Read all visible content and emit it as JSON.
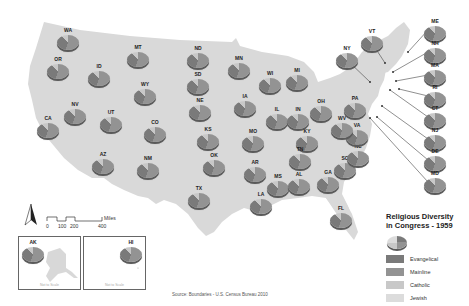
{
  "title": "Religious Diversity in Congress - 1959",
  "legend": {
    "title_line1": "Religious Diversity",
    "title_line2": "in Congress - 1959",
    "items": [
      {
        "label": "Evangelical",
        "color": "#7a7a7a"
      },
      {
        "label": "Mainline",
        "color": "#939393"
      },
      {
        "label": "Catholic",
        "color": "#c8c8c8"
      },
      {
        "label": "Jewish",
        "color": "#dcdcdc"
      }
    ]
  },
  "scale_bar": {
    "ticks": [
      "0",
      "100",
      "200",
      "400"
    ],
    "unit": "Miles"
  },
  "north_arrow": "N",
  "insets": [
    {
      "state": "AK",
      "note": "Not to Scale"
    },
    {
      "state": "HI",
      "note": "Not to Scale"
    }
  ],
  "source": "Source: Boundaries - U.S. Census Bureau 2010",
  "colors": {
    "land": "#d9d9d9",
    "evangelical": "#7a7a7a",
    "mainline": "#939393",
    "catholic": "#c8c8c8",
    "jewish": "#dcdcdc"
  },
  "states": [
    {
      "code": "WA",
      "x": 68,
      "y": 36
    },
    {
      "code": "OR",
      "x": 58,
      "y": 65
    },
    {
      "code": "ID",
      "x": 99,
      "y": 72
    },
    {
      "code": "MT",
      "x": 138,
      "y": 53
    },
    {
      "code": "WY",
      "x": 145,
      "y": 90
    },
    {
      "code": "NV",
      "x": 75,
      "y": 110
    },
    {
      "code": "UT",
      "x": 111,
      "y": 118
    },
    {
      "code": "CA",
      "x": 48,
      "y": 124
    },
    {
      "code": "CO",
      "x": 155,
      "y": 128
    },
    {
      "code": "AZ",
      "x": 103,
      "y": 160
    },
    {
      "code": "NM",
      "x": 148,
      "y": 164
    },
    {
      "code": "ND",
      "x": 198,
      "y": 54
    },
    {
      "code": "SD",
      "x": 198,
      "y": 80
    },
    {
      "code": "NE",
      "x": 200,
      "y": 106
    },
    {
      "code": "KS",
      "x": 208,
      "y": 135
    },
    {
      "code": "OK",
      "x": 214,
      "y": 161
    },
    {
      "code": "TX",
      "x": 199,
      "y": 194
    },
    {
      "code": "MN",
      "x": 239,
      "y": 64
    },
    {
      "code": "IA",
      "x": 245,
      "y": 102
    },
    {
      "code": "MO",
      "x": 253,
      "y": 137
    },
    {
      "code": "AR",
      "x": 255,
      "y": 168
    },
    {
      "code": "LA",
      "x": 261,
      "y": 200
    },
    {
      "code": "WI",
      "x": 270,
      "y": 79
    },
    {
      "code": "IL",
      "x": 277,
      "y": 115
    },
    {
      "code": "MI",
      "x": 297,
      "y": 76
    },
    {
      "code": "IN",
      "x": 298,
      "y": 115
    },
    {
      "code": "OH",
      "x": 321,
      "y": 107
    },
    {
      "code": "KY",
      "x": 307,
      "y": 137
    },
    {
      "code": "TN",
      "x": 300,
      "y": 155
    },
    {
      "code": "MS",
      "x": 278,
      "y": 182
    },
    {
      "code": "AL",
      "x": 299,
      "y": 180
    },
    {
      "code": "GA",
      "x": 328,
      "y": 178
    },
    {
      "code": "FL",
      "x": 341,
      "y": 214
    },
    {
      "code": "SC",
      "x": 345,
      "y": 164
    },
    {
      "code": "NC",
      "x": 358,
      "y": 152
    },
    {
      "code": "VA",
      "x": 357,
      "y": 131
    },
    {
      "code": "WV",
      "x": 342,
      "y": 124
    },
    {
      "code": "PA",
      "x": 355,
      "y": 104
    },
    {
      "code": "NY",
      "x": 347,
      "y": 54
    },
    {
      "code": "VT",
      "x": 372,
      "y": 37
    },
    {
      "code": "ME",
      "x": 435,
      "y": 27
    },
    {
      "code": "NH",
      "x": 435,
      "y": 49
    },
    {
      "code": "MA",
      "x": 435,
      "y": 71
    },
    {
      "code": "RI",
      "x": 435,
      "y": 93
    },
    {
      "code": "CT",
      "x": 435,
      "y": 114
    },
    {
      "code": "NJ",
      "x": 435,
      "y": 136
    },
    {
      "code": "DE",
      "x": 435,
      "y": 157
    },
    {
      "code": "MD",
      "x": 435,
      "y": 179
    },
    {
      "code": "AK",
      "x": 33,
      "y": 248
    },
    {
      "code": "HI",
      "x": 131,
      "y": 248
    }
  ]
}
